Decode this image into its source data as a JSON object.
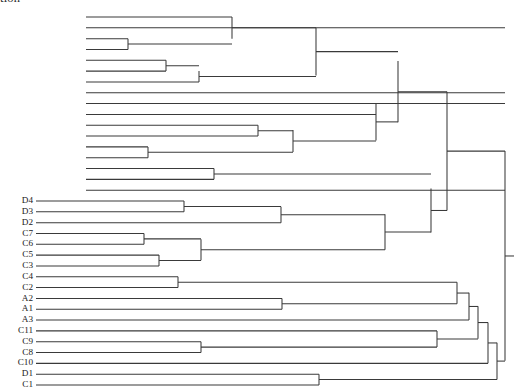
{
  "figure": {
    "clipped_caption_text": "tion",
    "background_color": "#ffffff",
    "line_color": "#3a3a3a",
    "label_color": "#1a1a1a",
    "width": 514,
    "height": 390
  },
  "chart_data": {
    "type": "dendrogram",
    "title": "",
    "xlabel": "",
    "ylabel": "",
    "orientation": "horizontal-right",
    "leaf_count": 34,
    "grid": false,
    "legend": null,
    "axis_visible": false,
    "note": "Hierarchical clustering dendrogram; only the lower 21 leaves carry visible tick labels, the upper 13 leaves are unlabeled.",
    "leaves": [
      {
        "index": 0,
        "label": "",
        "y": 17.0,
        "tip_x": 86
      },
      {
        "index": 1,
        "label": "",
        "y": 28.3,
        "tip_x": 86
      },
      {
        "index": 2,
        "label": "",
        "y": 39.6,
        "tip_x": 86
      },
      {
        "index": 3,
        "label": "",
        "y": 50.9,
        "tip_x": 86
      },
      {
        "index": 4,
        "label": "",
        "y": 62.2,
        "tip_x": 86
      },
      {
        "index": 5,
        "label": "",
        "y": 73.5,
        "tip_x": 86
      },
      {
        "index": 6,
        "label": "",
        "y": 84.8,
        "tip_x": 86
      },
      {
        "index": 7,
        "label": "",
        "y": 96.1,
        "tip_x": 86
      },
      {
        "index": 8,
        "label": "",
        "y": 107.4,
        "tip_x": 86
      },
      {
        "index": 9,
        "label": "",
        "y": 118.7,
        "tip_x": 86
      },
      {
        "index": 10,
        "label": "",
        "y": 130.0,
        "tip_x": 86
      },
      {
        "index": 11,
        "label": "",
        "y": 141.3,
        "tip_x": 86
      },
      {
        "index": 12,
        "label": "",
        "y": 152.6,
        "tip_x": 86
      },
      {
        "index": 13,
        "label": "",
        "y": 163.9,
        "tip_x": 86
      },
      {
        "index": 14,
        "label": "",
        "y": 175.2,
        "tip_x": 86
      },
      {
        "index": 15,
        "label": "",
        "y": 186.5,
        "tip_x": 86
      },
      {
        "index": 16,
        "label": "",
        "y": 197.8,
        "tip_x": 86
      },
      {
        "index": 17,
        "label": "D4",
        "y": 209.1,
        "tip_x": 36
      },
      {
        "index": 18,
        "label": "D3",
        "y": 220.4,
        "tip_x": 36
      },
      {
        "index": 19,
        "label": "D2",
        "y": 231.7,
        "tip_x": 36
      },
      {
        "index": 20,
        "label": "C7",
        "y": 243.0,
        "tip_x": 36
      },
      {
        "index": 21,
        "label": "C6",
        "y": 254.3,
        "tip_x": 36
      },
      {
        "index": 22,
        "label": "C5",
        "y": 265.6,
        "tip_x": 36
      },
      {
        "index": 23,
        "label": "C3",
        "y": 276.9,
        "tip_x": 36
      },
      {
        "index": 24,
        "label": "C4",
        "y": 288.2,
        "tip_x": 36
      },
      {
        "index": 25,
        "label": "C2",
        "y": 299.5,
        "tip_x": 36
      },
      {
        "index": 26,
        "label": "A2",
        "y": 310.8,
        "tip_x": 36
      },
      {
        "index": 27,
        "label": "A1",
        "y": 322.1,
        "tip_x": 36
      },
      {
        "index": 28,
        "label": "A3",
        "y": 333.4,
        "tip_x": 36
      },
      {
        "index": 29,
        "label": "C11",
        "y": 344.7,
        "tip_x": 36
      },
      {
        "index": 30,
        "label": "C9",
        "y": 356.0,
        "tip_x": 36
      },
      {
        "index": 31,
        "label": "C8",
        "y": 367.3,
        "tip_x": 36
      },
      {
        "index": 32,
        "label": "C10",
        "y": 378.6,
        "tip_x": 36
      },
      {
        "index": 33,
        "label": "D1",
        "y": 389.9,
        "tip_x": 36
      },
      {
        "index": 34,
        "label": "C1",
        "y": 401.2,
        "tip_x": 36
      }
    ],
    "merges": [
      {
        "id": "m1",
        "x": 232,
        "y_top": 17.0,
        "y_bottom": 39.6,
        "children": [
          "leaf0",
          "m0"
        ]
      },
      {
        "id": "m0",
        "x": 128,
        "y_top": 39.6,
        "y_bottom": 50.9,
        "children": [
          "leaf2",
          "leaf3"
        ]
      },
      {
        "id": "m2",
        "x": 166,
        "y_top": 62.2,
        "y_bottom": 73.5,
        "children": [
          "leaf4",
          "leaf5"
        ]
      },
      {
        "id": "m3",
        "x": 199,
        "y_top": 73.5,
        "y_bottom": 84.8,
        "children": [
          "m2",
          "leaf6"
        ]
      },
      {
        "id": "m4",
        "x": 316,
        "y_top": 28.3,
        "y_bottom": 78.0,
        "children": [
          "m1",
          "m3"
        ]
      },
      {
        "id": "m5",
        "x": 258,
        "y_top": 130.0,
        "y_bottom": 141.3,
        "children": [
          "leaf10",
          "leaf11"
        ]
      },
      {
        "id": "m6",
        "x": 148,
        "y_top": 152.6,
        "y_bottom": 163.9,
        "children": [
          "leaf12",
          "leaf13"
        ]
      },
      {
        "id": "m7",
        "x": 293,
        "y_top": 135.0,
        "y_bottom": 158.0,
        "children": [
          "m5",
          "m6"
        ]
      },
      {
        "id": "m8",
        "x": 214,
        "y_top": 175.2,
        "y_bottom": 186.5,
        "children": [
          "leaf14",
          "leaf15"
        ]
      },
      {
        "id": "m9",
        "x": 376,
        "y_top": 107.0,
        "y_bottom": 146.0,
        "children": [
          "m7",
          "leaf9"
        ]
      },
      {
        "id": "m10",
        "x": 398,
        "y_top": 63.0,
        "y_bottom": 127.0,
        "children": [
          "m4",
          "m9"
        ]
      },
      {
        "id": "m11",
        "x": 184,
        "y_top": 209.1,
        "y_bottom": 220.4,
        "children": [
          "leafD4",
          "leafD3"
        ]
      },
      {
        "id": "m12",
        "x": 144,
        "y_top": 243.0,
        "y_bottom": 254.3,
        "children": [
          "leafC7",
          "leafC6"
        ]
      },
      {
        "id": "m13",
        "x": 159,
        "y_top": 265.6,
        "y_bottom": 276.9,
        "children": [
          "leafC5",
          "leafC3"
        ]
      },
      {
        "id": "m14",
        "x": 201,
        "y_top": 249.0,
        "y_bottom": 271.0,
        "children": [
          "m12",
          "m13"
        ]
      },
      {
        "id": "m15",
        "x": 281,
        "y_top": 215.0,
        "y_bottom": 231.7,
        "children": [
          "m11",
          "leafD2"
        ]
      },
      {
        "id": "m16",
        "x": 385,
        "y_top": 223.0,
        "y_bottom": 260.0,
        "children": [
          "m15",
          "m14"
        ]
      },
      {
        "id": "m17",
        "x": 178,
        "y_top": 288.2,
        "y_bottom": 299.5,
        "children": [
          "leafC4",
          "leafC2"
        ]
      },
      {
        "id": "m18",
        "x": 282,
        "y_top": 310.8,
        "y_bottom": 322.1,
        "children": [
          "leafA2",
          "leafA1"
        ]
      },
      {
        "id": "m19",
        "x": 201,
        "y_top": 356.0,
        "y_bottom": 367.3,
        "children": [
          "leafC9",
          "leafC8"
        ]
      },
      {
        "id": "m20",
        "x": 319,
        "y_top": 389.9,
        "y_bottom": 401.2,
        "children": [
          "leafD1",
          "leafC1"
        ]
      },
      {
        "id": "m21",
        "x": 431,
        "y_top": 196.0,
        "y_bottom": 242.0,
        "children": [
          "m8",
          "m16"
        ]
      },
      {
        "id": "m22",
        "x": 447,
        "y_top": 95.0,
        "y_bottom": 219.0,
        "children": [
          "m10",
          "m21"
        ]
      },
      {
        "id": "m23",
        "x": 457,
        "y_top": 293.9,
        "y_bottom": 316.5,
        "children": [
          "m17",
          "m18"
        ]
      },
      {
        "id": "m24",
        "x": 469,
        "y_top": 305.0,
        "y_bottom": 333.4,
        "children": [
          "m23",
          "leafA3"
        ]
      },
      {
        "id": "m25",
        "x": 437,
        "y_top": 344.7,
        "y_bottom": 361.6,
        "children": [
          "leafC11",
          "m19"
        ]
      },
      {
        "id": "m26",
        "x": 478,
        "y_top": 319.0,
        "y_bottom": 353.0,
        "children": [
          "m24",
          "m25"
        ]
      },
      {
        "id": "m27",
        "x": 488,
        "y_top": 336.0,
        "y_bottom": 378.6,
        "children": [
          "m26",
          "leafC10"
        ]
      },
      {
        "id": "m28",
        "x": 497,
        "y_top": 357.0,
        "y_bottom": 395.5,
        "children": [
          "m27",
          "m20"
        ]
      },
      {
        "id": "m29",
        "x": 505,
        "y_top": 157.0,
        "y_bottom": 376.0,
        "children": [
          "m22",
          "m28"
        ]
      }
    ],
    "root": {
      "id": "m29",
      "x": 505,
      "y": 266.5,
      "stub_length": 9
    }
  }
}
